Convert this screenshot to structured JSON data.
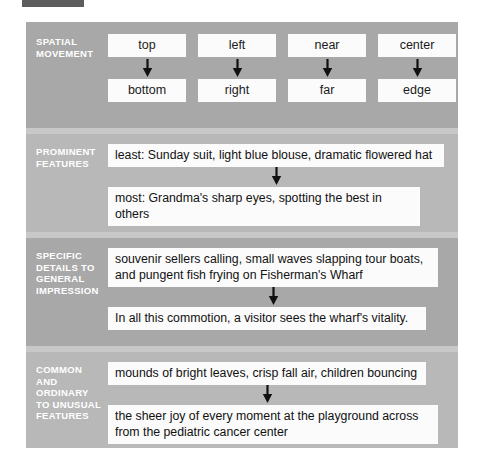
{
  "figure": {
    "sections": [
      {
        "label_lines": [
          "Spatial",
          "Movement"
        ],
        "type": "columns",
        "columns": [
          {
            "from": "top",
            "to": "bottom"
          },
          {
            "from": "left",
            "to": "right"
          },
          {
            "from": "near",
            "to": "far"
          },
          {
            "from": "center",
            "to": "edge"
          }
        ]
      },
      {
        "label_lines": [
          "Prominent",
          "Features"
        ],
        "type": "rows",
        "rows": [
          "least: Sunday suit, light blue blouse, dramatic flowered hat",
          "most: Grandma's sharp eyes, spotting the best in others"
        ]
      },
      {
        "label_lines": [
          "Specific",
          "Details to",
          "General",
          "Impression"
        ],
        "type": "rows",
        "rows": [
          "souvenir sellers calling, small waves slapping tour boats, and pungent fish frying on Fisherman's Wharf",
          "In all this commotion, a visitor sees the wharf's vitality."
        ]
      },
      {
        "label_lines": [
          "Common",
          "and",
          "Ordinary",
          "to Unusual",
          "Features"
        ],
        "type": "rows",
        "rows": [
          "mounds of bright leaves, crisp fall air, children bouncing",
          "the sheer joy of every moment at the playground across from the pediatric cancer center"
        ]
      }
    ],
    "icons": {
      "arrow": "arrow-down-icon"
    },
    "colors": {
      "panel": "#b4b4b4",
      "band": "#a8a8a8",
      "band_alt": "#b8b8b8",
      "separator": "#c8c8c8",
      "box": "#fbfbfb",
      "label_text": "#ffffff",
      "body_text": "#111111",
      "corner_mark": "#5d5d5d"
    }
  }
}
